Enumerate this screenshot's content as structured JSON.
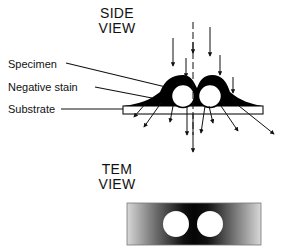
{
  "side_view": {
    "title_line1": "SIDE",
    "title_line2": "VIEW",
    "labels": {
      "specimen": "Specimen",
      "negative_stain": "Negative stain",
      "substrate": "Substrate"
    }
  },
  "tem_view": {
    "title_line1": "TEM",
    "title_line2": "VIEW"
  },
  "colors": {
    "ink": "#111111",
    "background": "#ffffff",
    "stain": "#000000"
  }
}
